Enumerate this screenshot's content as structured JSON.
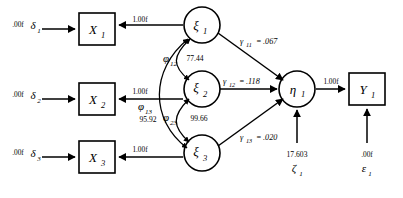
{
  "diagram": {
    "type": "structural-equation-model-path-diagram",
    "observed_variables": [
      {
        "id": "X1",
        "label": "X",
        "subscript": "1"
      },
      {
        "id": "X2",
        "label": "X",
        "subscript": "2"
      },
      {
        "id": "X3",
        "label": "X",
        "subscript": "3"
      },
      {
        "id": "Y1",
        "label": "Y",
        "subscript": "1"
      }
    ],
    "latent_variables": [
      {
        "id": "xi1",
        "label": "ξ",
        "subscript": "1"
      },
      {
        "id": "xi2",
        "label": "ξ",
        "subscript": "2"
      },
      {
        "id": "xi3",
        "label": "ξ",
        "subscript": "3"
      },
      {
        "id": "eta1",
        "label": "η",
        "subscript": "1"
      }
    ],
    "error_terms": [
      {
        "id": "delta1",
        "label": "δ",
        "subscript": "1",
        "value": ".00f"
      },
      {
        "id": "delta2",
        "label": "δ",
        "subscript": "2",
        "value": ".00f"
      },
      {
        "id": "delta3",
        "label": "δ",
        "subscript": "3",
        "value": ".00f"
      },
      {
        "id": "zeta1",
        "label": "ζ",
        "subscript": "1",
        "value": "17.603"
      },
      {
        "id": "epsilon1",
        "label": "ε",
        "subscript": "1",
        "value": ".00f"
      }
    ],
    "loadings": [
      {
        "id": "lambda_x1",
        "from": "xi1",
        "to": "X1",
        "value": "1.00f"
      },
      {
        "id": "lambda_x2",
        "from": "xi2",
        "to": "X2",
        "value": "1.00f"
      },
      {
        "id": "lambda_x3",
        "from": "xi3",
        "to": "X3",
        "value": "1.00f"
      },
      {
        "id": "lambda_y1",
        "from": "eta1",
        "to": "Y1",
        "value": "1.00f"
      }
    ],
    "structural_paths": [
      {
        "id": "gamma11",
        "symbol": "γ",
        "subscript": "11",
        "from": "xi1",
        "to": "eta1",
        "equals": "=",
        "value": ".067"
      },
      {
        "id": "gamma12",
        "symbol": "γ",
        "subscript": "12",
        "from": "xi2",
        "to": "eta1",
        "equals": "=",
        "value": ".118"
      },
      {
        "id": "gamma13",
        "symbol": "γ",
        "subscript": "13",
        "from": "xi3",
        "to": "eta1",
        "equals": "=",
        "value": ".020"
      }
    ],
    "covariances": [
      {
        "id": "phi12",
        "symbol": "φ",
        "subscript": "12",
        "between": [
          "xi1",
          "xi2"
        ],
        "value": "77.44"
      },
      {
        "id": "phi13",
        "symbol": "φ",
        "subscript": "13",
        "between": [
          "xi1",
          "xi3"
        ],
        "value": "95.92"
      },
      {
        "id": "phi23",
        "symbol": "φ",
        "subscript": "23",
        "between": [
          "xi2",
          "xi3"
        ],
        "value": "99.66"
      }
    ],
    "colors": {
      "stroke": "#000000",
      "fill": "#ffffff",
      "background": "#ffffff"
    }
  }
}
